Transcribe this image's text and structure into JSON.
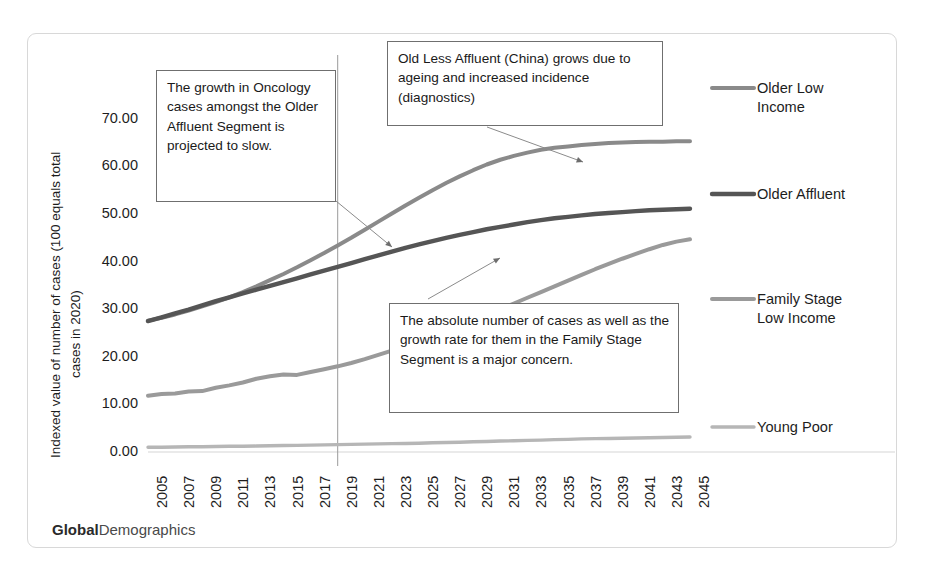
{
  "brand": {
    "bold": "Global",
    "rest": "Demographics"
  },
  "chart_data": {
    "type": "line",
    "title": "",
    "xlabel": "",
    "ylabel": "Indexed value of number of cases  (100 equals total cases in 2020)",
    "ylabel_line1": "Indexed value of number of cases  (100 equals total",
    "ylabel_line2": "cases in 2020)",
    "ylim": [
      0,
      75
    ],
    "yticks": [
      0,
      10,
      20,
      30,
      40,
      50,
      60,
      70
    ],
    "ytick_labels": [
      "0.00",
      "10.00",
      "20.00",
      "30.00",
      "40.00",
      "50.00",
      "60.00",
      "70.00"
    ],
    "xlim": [
      2005,
      2045
    ],
    "x": [
      2005,
      2006,
      2007,
      2008,
      2009,
      2010,
      2011,
      2012,
      2013,
      2014,
      2015,
      2016,
      2017,
      2018,
      2019,
      2020,
      2021,
      2022,
      2023,
      2024,
      2025,
      2026,
      2027,
      2028,
      2029,
      2030,
      2031,
      2032,
      2033,
      2034,
      2035,
      2036,
      2037,
      2038,
      2039,
      2040,
      2041,
      2042,
      2043,
      2044,
      2045
    ],
    "xtick_labels": [
      "2005",
      "2007",
      "2009",
      "2011",
      "2013",
      "2015",
      "2017",
      "2019",
      "2021",
      "2023",
      "2025",
      "2027",
      "2029",
      "2031",
      "2033",
      "2035",
      "2037",
      "2039",
      "2041",
      "2043",
      "2045"
    ],
    "grid": false,
    "legend_position": "right-end-of-line",
    "series": [
      {
        "name": "Older Low Income",
        "label_lines": "Older Low\nIncome",
        "color": "#8a8a8a",
        "values": [
          27.6,
          28.2,
          28.9,
          29.7,
          30.6,
          31.5,
          32.5,
          33.6,
          34.8,
          36.1,
          37.4,
          38.8,
          40.3,
          41.8,
          43.4,
          45.0,
          46.7,
          48.4,
          50.1,
          51.8,
          53.4,
          55.0,
          56.5,
          57.9,
          59.2,
          60.4,
          61.4,
          62.2,
          62.9,
          63.5,
          63.9,
          64.2,
          64.5,
          64.7,
          64.9,
          65.0,
          65.1,
          65.2,
          65.2,
          65.3,
          65.3
        ]
      },
      {
        "name": "Older Affluent",
        "label_lines": "Older Affluent",
        "color": "#555555",
        "values": [
          27.5,
          28.3,
          29.1,
          29.9,
          30.8,
          31.7,
          32.5,
          33.3,
          34.1,
          34.9,
          35.7,
          36.5,
          37.3,
          38.1,
          38.9,
          39.7,
          40.5,
          41.3,
          42.1,
          42.9,
          43.6,
          44.3,
          45.0,
          45.6,
          46.2,
          46.8,
          47.3,
          47.8,
          48.3,
          48.7,
          49.1,
          49.4,
          49.7,
          50.0,
          50.2,
          50.4,
          50.6,
          50.8,
          50.9,
          51.0,
          51.1
        ]
      },
      {
        "name": "Family Stage Low Income",
        "label_lines": "Family Stage\nLow Income",
        "color": "#9a9a9a",
        "values": [
          11.8,
          12.2,
          12.3,
          12.7,
          12.8,
          13.5,
          14.0,
          14.6,
          15.4,
          15.9,
          16.3,
          16.2,
          16.8,
          17.4,
          18.0,
          18.7,
          19.5,
          20.4,
          21.3,
          22.3,
          23.3,
          24.3,
          25.4,
          26.5,
          27.6,
          28.8,
          30.0,
          31.2,
          32.4,
          33.6,
          34.8,
          36.0,
          37.2,
          38.4,
          39.5,
          40.6,
          41.6,
          42.6,
          43.5,
          44.2,
          44.7
        ]
      },
      {
        "name": "Young Poor",
        "label_lines": "Young Poor",
        "color": "#b6b6b6",
        "values": [
          1.0,
          1.0,
          1.05,
          1.1,
          1.1,
          1.15,
          1.2,
          1.2,
          1.25,
          1.3,
          1.35,
          1.4,
          1.45,
          1.5,
          1.55,
          1.6,
          1.65,
          1.7,
          1.75,
          1.8,
          1.85,
          1.95,
          2.0,
          2.05,
          2.15,
          2.2,
          2.3,
          2.35,
          2.45,
          2.5,
          2.6,
          2.65,
          2.75,
          2.8,
          2.85,
          2.9,
          2.95,
          3.0,
          3.05,
          3.1,
          3.15
        ]
      }
    ],
    "marker_line": {
      "x": 2019,
      "label": "2019"
    },
    "annotations": [
      {
        "id": "oncology-slowdown",
        "text": "The growth in Oncology cases amongst the Older Affluent Segment is projected to slow."
      },
      {
        "id": "china-growth",
        "text": "Old Less Affluent (China) grows due to ageing and increased incidence (diagnostics)"
      },
      {
        "id": "family-stage-concern",
        "text": "The absolute number of cases as well as the growth rate for them in the Family Stage Segment is a major concern."
      }
    ]
  }
}
